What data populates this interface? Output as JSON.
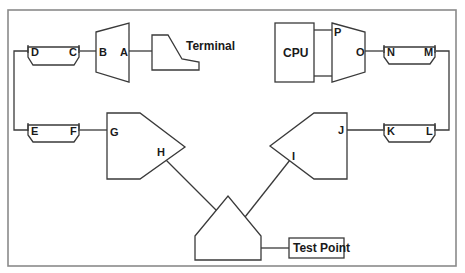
{
  "diagram": {
    "type": "network-topology",
    "nodes": {
      "terminal": {
        "label": "Terminal"
      },
      "cpu": {
        "label": "CPU"
      },
      "test_point": {
        "label": "Test Point"
      },
      "mux_left": {
        "ports": [
          "B",
          "A"
        ]
      },
      "mux_right": {
        "ports": [
          "P",
          "O"
        ]
      },
      "connector_dc": {
        "ports": [
          "D",
          "C"
        ]
      },
      "connector_ef": {
        "ports": [
          "E",
          "F"
        ]
      },
      "connector_nm": {
        "ports": [
          "N",
          "M"
        ]
      },
      "connector_kl": {
        "ports": [
          "K",
          "L"
        ]
      },
      "amp_left": {
        "ports": [
          "G",
          "H"
        ]
      },
      "amp_right": {
        "ports": [
          "I",
          "J"
        ]
      },
      "combiner": {
        "ports": []
      }
    },
    "labels": {
      "A": "A",
      "B": "B",
      "C": "C",
      "D": "D",
      "E": "E",
      "F": "F",
      "G": "G",
      "H": "H",
      "I": "I",
      "J": "J",
      "K": "K",
      "L": "L",
      "M": "M",
      "N": "N",
      "O": "O",
      "P": "P"
    },
    "edges": [
      [
        "Terminal",
        "A"
      ],
      [
        "B",
        "C"
      ],
      [
        "D",
        "E"
      ],
      [
        "F",
        "G"
      ],
      [
        "H",
        "combiner"
      ],
      [
        "I",
        "combiner"
      ],
      [
        "combiner",
        "Test Point"
      ],
      [
        "J",
        "K"
      ],
      [
        "L",
        "M"
      ],
      [
        "N",
        "O"
      ],
      [
        "P",
        "CPU"
      ]
    ],
    "colors": {
      "line": "#3a3a3a",
      "border": "#8a8a8a",
      "background": "#ffffff"
    }
  }
}
